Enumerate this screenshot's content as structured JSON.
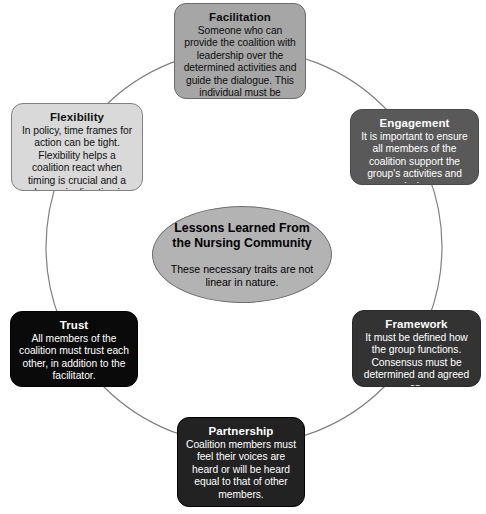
{
  "diagram": {
    "center": {
      "title": "Lessons Learned From the Nursing Community",
      "subtitle": "These necessary traits are not linear in nature."
    },
    "ring": {
      "shape": "circle",
      "stroke_color": "#808080"
    },
    "nodes": [
      {
        "id": "facilitation",
        "title": "Facilitation",
        "body": "Someone who can provide the coalition with leadership over the determined activities and guide the dialogue. This individual must be trusted.",
        "fill": "#a6a6a6",
        "text_color": "#0d0d0d",
        "position": "top"
      },
      {
        "id": "engagement",
        "title": "Engagement",
        "body": "It is important to ensure all members of the coalition support the group's activities and mission.",
        "fill": "#595959",
        "text_color": "#ffffff",
        "position": "upper-right"
      },
      {
        "id": "framework",
        "title": "Framework",
        "body": "It must be defined how the group functions. Consensus must be determined and agreed on.",
        "fill": "#333333",
        "text_color": "#ffffff",
        "position": "lower-right"
      },
      {
        "id": "partnership",
        "title": "Partnership",
        "body": "Coalition members must feel their voices are heard or will be heard equal to that of other members.",
        "fill": "#222222",
        "text_color": "#ffffff",
        "position": "bottom"
      },
      {
        "id": "trust",
        "title": "Trust",
        "body": "All members of the coalition must trust each other, in addition to the facilitator.",
        "fill": "#0a0a0a",
        "text_color": "#ffffff",
        "position": "lower-left"
      },
      {
        "id": "flexibility",
        "title": "Flexibility",
        "body": "In policy, time frames for action can be tight. Flexibility helps a coalition react when timing is crucial and a change in direction is necessary.",
        "fill": "#d9d9d9",
        "text_color": "#111111",
        "position": "upper-left"
      }
    ]
  }
}
